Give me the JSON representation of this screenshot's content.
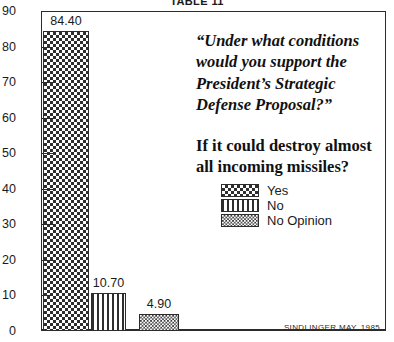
{
  "table_title": "TABLE 11",
  "question": {
    "quote": "“Under what conditions would you support the President’s Strategic Defense Proposal?”",
    "followup": "If it could destroy almost all incoming missiles?"
  },
  "source": "SINDLINGER    MAY, 1985",
  "legend": {
    "items": [
      {
        "label": "Yes",
        "pattern": "checkerboard"
      },
      {
        "label": "No",
        "pattern": "vertical-stripe"
      },
      {
        "label": "No Opinion",
        "pattern": "diagonal-hatch"
      }
    ]
  },
  "chart_data": {
    "type": "bar",
    "title": "TABLE 11",
    "xlabel": "",
    "ylabel": "",
    "ylim": [
      0,
      90
    ],
    "yticks": [
      0,
      10,
      20,
      30,
      40,
      50,
      60,
      70,
      80,
      90
    ],
    "ytick_labels": [
      "0",
      "10",
      "20",
      "30",
      "40",
      "50",
      "60",
      "70",
      "80",
      "90"
    ],
    "grid": false,
    "legend_position": "inside-right",
    "categories": [
      "Yes",
      "No",
      "No Opinion"
    ],
    "values": [
      84.4,
      10.7,
      4.9
    ],
    "value_labels": [
      "84.40",
      "10.70",
      "4.90"
    ],
    "patterns": [
      "checkerboard",
      "vertical-stripe",
      "diagonal-hatch"
    ],
    "annotations": [
      "“Under what conditions would you support the President’s Strategic Defense Proposal?”",
      "If it could destroy almost all incoming missiles?",
      "SINDLINGER    MAY, 1985"
    ],
    "colors": {
      "ink": "#2b2b2b",
      "background": "#ffffff"
    }
  }
}
